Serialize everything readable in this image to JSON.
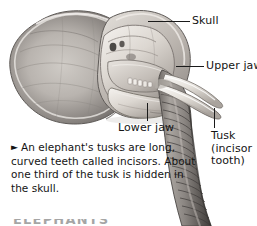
{
  "figure": {
    "background_color": "#ffffff",
    "line_color": "#1a1a1a",
    "text_color": "#141414"
  },
  "callouts": [
    {
      "id": "skull",
      "label": "Skull"
    },
    {
      "id": "upper-jaw",
      "label": "Upper jaw"
    },
    {
      "id": "lower-jaw",
      "label": "Lower jaw"
    },
    {
      "id": "tusk",
      "label": "Tusk\n(incisor\ntooth)"
    }
  ],
  "caption": {
    "marker": "►",
    "text": "An elephant's tusks are long, curved teeth called incisors. About one third of the tusk is hidden in the skull."
  },
  "bottom_heading": {
    "text": "ELEPHANTS"
  }
}
